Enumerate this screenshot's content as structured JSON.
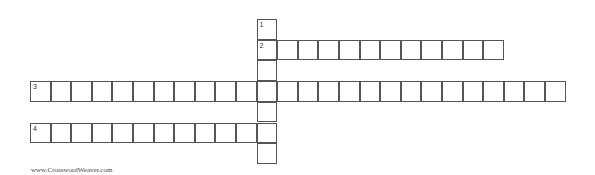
{
  "puzzle": {
    "origin": {
      "x": 30,
      "y": 19
    },
    "cell_size": {
      "w": 20.6,
      "h": 20.7
    },
    "words": [
      {
        "number": "1",
        "direction": "down",
        "row": 0,
        "col": 11,
        "length": 7
      },
      {
        "number": "2",
        "direction": "across",
        "row": 1,
        "col": 11,
        "length": 12
      },
      {
        "number": "3",
        "direction": "across",
        "row": 3,
        "col": 0,
        "length": 26
      },
      {
        "number": "4",
        "direction": "across",
        "row": 5,
        "col": 0,
        "length": 12
      }
    ]
  },
  "footer": {
    "text": "www.CrosswordWeaver.com"
  }
}
